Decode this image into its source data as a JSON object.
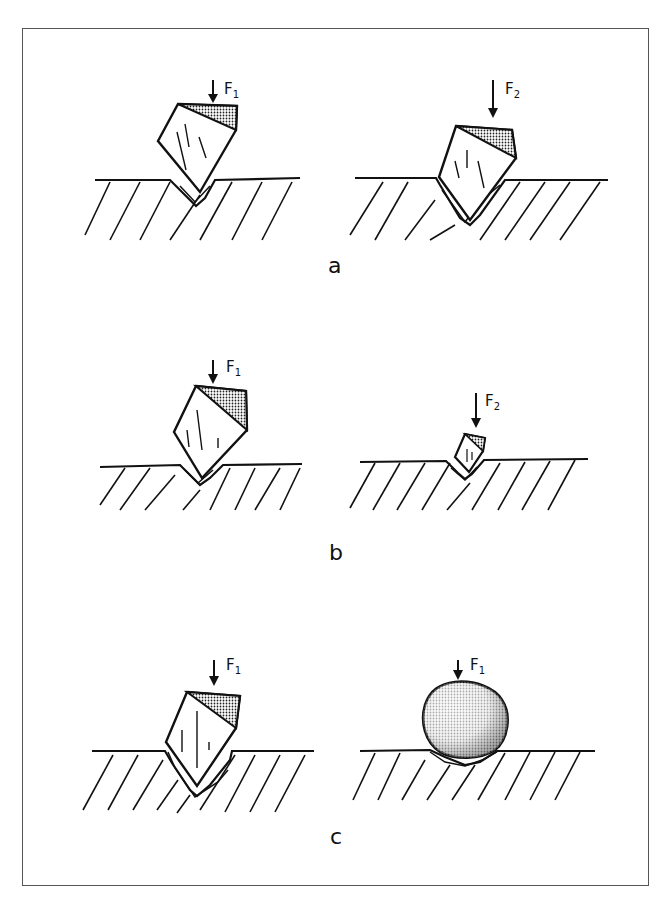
{
  "figure": {
    "panels": [
      {
        "label": "a",
        "left": {
          "force": "F",
          "sub": "1"
        },
        "right": {
          "force": "F",
          "sub": "2"
        }
      },
      {
        "label": "b",
        "left": {
          "force": "F",
          "sub": "1"
        },
        "right": {
          "force": "F",
          "sub": "2"
        }
      },
      {
        "label": "c",
        "left": {
          "force": "F",
          "sub": "1"
        },
        "right": {
          "force": "F",
          "sub": "1"
        }
      }
    ]
  }
}
